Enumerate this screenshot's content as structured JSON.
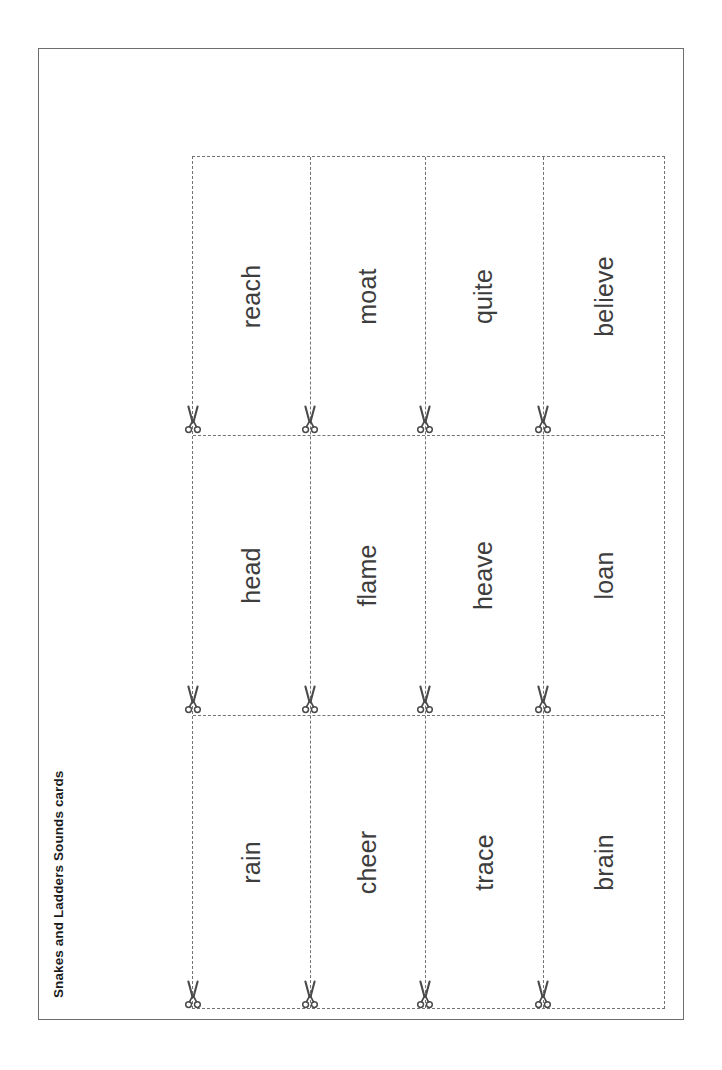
{
  "page": {
    "title": "Snakes and Ladders Sounds cards",
    "border_color": "#6e6e6e",
    "background_color": "#ffffff",
    "text_color": "#3d3d3d",
    "title_color": "#1c1c1c",
    "cut_line_color": "#737373",
    "scissors_color": "#4a4a4a"
  },
  "cut_grid": {
    "icon": "scissors-icon",
    "columns": 4,
    "rows": 3,
    "cards": [
      {
        "row": 0,
        "column": 0,
        "word": "reach"
      },
      {
        "row": 0,
        "column": 1,
        "word": "moat"
      },
      {
        "row": 0,
        "column": 2,
        "word": "quite"
      },
      {
        "row": 0,
        "column": 3,
        "word": "believe"
      },
      {
        "row": 1,
        "column": 0,
        "word": "head"
      },
      {
        "row": 1,
        "column": 1,
        "word": "flame"
      },
      {
        "row": 1,
        "column": 2,
        "word": "heave"
      },
      {
        "row": 1,
        "column": 3,
        "word": "loan"
      },
      {
        "row": 2,
        "column": 0,
        "word": "rain"
      },
      {
        "row": 2,
        "column": 1,
        "word": "cheer"
      },
      {
        "row": 2,
        "column": 2,
        "word": "trace"
      },
      {
        "row": 2,
        "column": 3,
        "word": "brain"
      }
    ]
  }
}
